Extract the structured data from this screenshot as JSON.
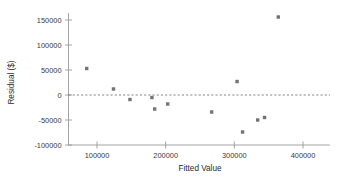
{
  "chart_data": {
    "type": "scatter",
    "title": "",
    "xlabel": "Fitted Value",
    "ylabel": "Residual ($)",
    "xlim": [
      70000,
      415000
    ],
    "ylim": [
      -108000,
      162000
    ],
    "xticks": [
      100000,
      200000,
      300000,
      400000
    ],
    "xtick_labels": [
      "100000",
      "200000",
      "300000",
      "400000"
    ],
    "yticks": [
      150000,
      100000,
      50000,
      0,
      -50000,
      -100000
    ],
    "ytick_labels": [
      "150000",
      "100000",
      "50000",
      "0",
      "-50000",
      "-100000"
    ],
    "grid": false,
    "legend": null,
    "reference_lines": [
      {
        "name": "zero-residual-line",
        "orientation": "horizontal",
        "y": 0,
        "style": "dashed"
      }
    ],
    "marker": {
      "shape": "square",
      "color": "#737373",
      "size": 3.4
    },
    "points": [
      {
        "x": 85000,
        "y": 53000
      },
      {
        "x": 124000,
        "y": 12000
      },
      {
        "x": 148000,
        "y": -9000
      },
      {
        "x": 180000,
        "y": -5000
      },
      {
        "x": 184000,
        "y": -28000
      },
      {
        "x": 203000,
        "y": -18000
      },
      {
        "x": 267000,
        "y": -34000
      },
      {
        "x": 304000,
        "y": 27000
      },
      {
        "x": 312000,
        "y": -74000
      },
      {
        "x": 334000,
        "y": -50000
      },
      {
        "x": 344000,
        "y": -45000
      },
      {
        "x": 364000,
        "y": 156000
      }
    ]
  },
  "axes": {
    "x_title": "Fitted Value",
    "y_title": "Residual ($)",
    "x_tick_labels": [
      "100000",
      "200000",
      "300000",
      "400000"
    ],
    "y_tick_labels": [
      "150000",
      "100000",
      "50000",
      "0",
      "-50000",
      "-100000"
    ]
  },
  "colors": {
    "marker": "#737373",
    "axis": "#9a9a9a",
    "zero_line": "#6e6e6e",
    "text": "#2b2b2b",
    "background": "#ffffff"
  }
}
